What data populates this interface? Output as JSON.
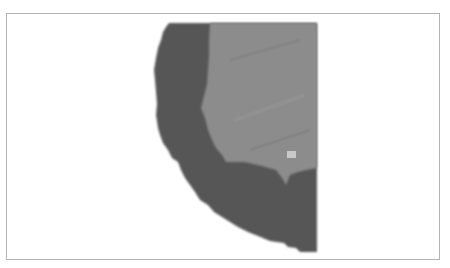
{
  "figure": {
    "colors": {
      "frame_border": "#b4b4b4",
      "background": "#ffffff",
      "outer_region": "#565656",
      "inner_region": "#8c8c8c",
      "highlight_spot": "#c8c8c8"
    }
  }
}
